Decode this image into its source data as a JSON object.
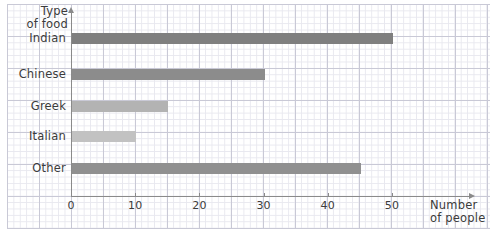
{
  "chart_data": {
    "type": "bar",
    "orientation": "horizontal",
    "title": "",
    "categories": [
      "Indian",
      "Chinese",
      "Greek",
      "Italian",
      "Other"
    ],
    "values": [
      50,
      30,
      15,
      10,
      45
    ],
    "xlabel": "Number of people",
    "ylabel": "Type of food",
    "xlim": [
      0,
      55
    ],
    "xticks": [
      0,
      10,
      20,
      30,
      40,
      50
    ],
    "xtick_labels": [
      "0",
      "10",
      "20",
      "30",
      "40",
      "50"
    ],
    "grid": true,
    "grid_style": "graph-paper",
    "legend": "none",
    "bar_colors": [
      "#7f7f7f",
      "#8c8c8c",
      "#b3b3b3",
      "#c2c2c2",
      "#909090"
    ]
  },
  "axes": {
    "y_title_line1": "Type",
    "y_title_line2": "of food",
    "x_title_line1": "Number",
    "x_title_line2": "of people"
  },
  "colors": {
    "axis": "#8a8a8a",
    "text": "#3b3b3b",
    "grid_minor": "#e8e8ef",
    "grid_major": "#c9c9d6",
    "background": "#ffffff"
  }
}
